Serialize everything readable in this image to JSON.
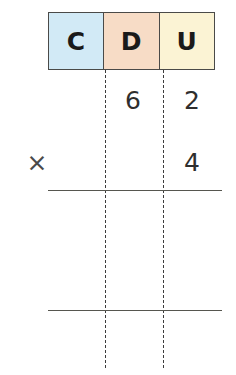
{
  "worksheet": {
    "title": "Place value multiplication grid",
    "columns": [
      {
        "key": "c",
        "label": "C",
        "color": "#d2eaf6",
        "meaning": "hundreds"
      },
      {
        "key": "d",
        "label": "D",
        "color": "#f7dcc6",
        "meaning": "tens"
      },
      {
        "key": "u",
        "label": "U",
        "color": "#fbf3d4",
        "meaning": "units"
      }
    ],
    "operand_row": {
      "hundreds": "",
      "tens": "6",
      "units": "2"
    },
    "multiplier_row": {
      "operator": "×",
      "hundreds": "",
      "tens": "",
      "units": "4"
    },
    "answer_rows": [
      {
        "hundreds": "",
        "tens": "",
        "units": ""
      },
      {
        "hundreds": "",
        "tens": "",
        "units": ""
      }
    ],
    "rules": [
      {
        "name": "first-rule"
      },
      {
        "name": "second-rule"
      }
    ],
    "colors": {
      "hundreds_cell": "#d2eaf6",
      "tens_cell": "#f7dcc6",
      "units_cell": "#fbf3d4",
      "table_border": "#4a4a48",
      "guide_line": "#3c3c3c",
      "rule_line": "#56564f",
      "digit_text": "#2e2e2e",
      "header_text": "#1a1a1a",
      "page_background": "#ffffff"
    }
  }
}
